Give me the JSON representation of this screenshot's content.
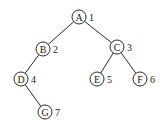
{
  "diagram": {
    "type": "binary-tree",
    "nodes": [
      {
        "id": "A",
        "label": "A",
        "index": "1",
        "x": 79,
        "y": 17
      },
      {
        "id": "B",
        "label": "B",
        "index": "2",
        "x": 43,
        "y": 49
      },
      {
        "id": "C",
        "label": "C",
        "index": "3",
        "x": 117,
        "y": 47
      },
      {
        "id": "D",
        "label": "D",
        "index": "4",
        "x": 21,
        "y": 79
      },
      {
        "id": "E",
        "label": "E",
        "index": "5",
        "x": 97,
        "y": 79
      },
      {
        "id": "F",
        "label": "F",
        "index": "6",
        "x": 140,
        "y": 79
      },
      {
        "id": "G",
        "label": "G",
        "index": "7",
        "x": 45,
        "y": 112
      }
    ],
    "edges": [
      {
        "from": "A",
        "to": "B"
      },
      {
        "from": "A",
        "to": "C"
      },
      {
        "from": "B",
        "to": "D"
      },
      {
        "from": "C",
        "to": "E"
      },
      {
        "from": "C",
        "to": "F"
      },
      {
        "from": "D",
        "to": "G"
      }
    ],
    "style": {
      "node_radius": 7,
      "stroke": "#2a2a2a",
      "background": "#ffffff"
    }
  }
}
